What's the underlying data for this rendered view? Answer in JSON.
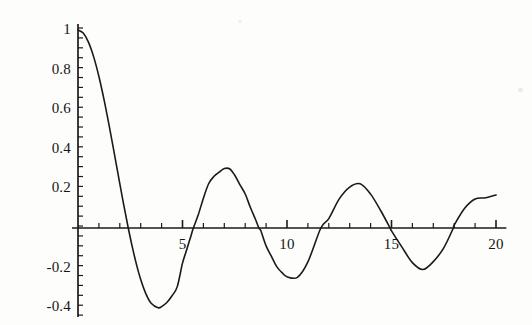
{
  "chart_data": {
    "type": "line",
    "title": "",
    "subtitle": "",
    "xlabel": "",
    "ylabel": "",
    "xlim": [
      0,
      20.4
    ],
    "ylim": [
      -0.44,
      1.02
    ],
    "grid": false,
    "legend": null,
    "axis_style": "crossing-at-origin",
    "minor_ticks": true,
    "x_ticks_major": [
      5,
      10,
      15,
      20
    ],
    "x_tick_labels": [
      "5",
      "10",
      "15",
      "20"
    ],
    "x_ticks_minor_step": 1,
    "y_ticks_major": [
      1,
      0.8,
      0.6,
      0.4,
      0.2,
      -0.2,
      -0.4
    ],
    "y_tick_labels": [
      "1",
      "0.8",
      "0.6",
      "0.4",
      "0.2",
      "-0.2",
      "-0.4"
    ],
    "y_ticks_minor_step": 0.05,
    "series": [
      {
        "name": "curve",
        "color": "#1a1a1a",
        "width": 1.6,
        "x": [
          0,
          0.25,
          0.5,
          0.75,
          1,
          1.25,
          1.5,
          1.75,
          2,
          2.2,
          2.4048,
          2.6,
          2.8,
          3,
          3.25,
          3.5,
          3.8317,
          4,
          4.25,
          4.5,
          4.75,
          5,
          5.2,
          5.4,
          5.5201,
          5.75,
          6,
          6.25,
          6.5,
          6.75,
          7,
          7.25,
          7.5,
          7.75,
          8,
          8.25,
          8.5,
          8.6537,
          8.75,
          9,
          9.25,
          9.5,
          9.75,
          10,
          10.5,
          11,
          11.6198,
          12,
          12.5,
          13,
          13.5,
          14,
          14.5,
          14.9309,
          15,
          15.5,
          16,
          16.5,
          17,
          17.5,
          17.9598,
          18,
          18.5,
          19,
          19.5,
          20
        ],
        "y": [
          1.0,
          0.9844,
          0.9385,
          0.8642,
          0.7652,
          0.6459,
          0.5118,
          0.369,
          0.2239,
          0.1104,
          0.0,
          -0.0968,
          -0.185,
          -0.2601,
          -0.3325,
          -0.3801,
          -0.4028,
          -0.3971,
          -0.3766,
          -0.3423,
          -0.2961,
          -0.1776,
          -0.1103,
          -0.0412,
          0.0,
          0.0652,
          0.1506,
          0.2236,
          0.2601,
          0.2818,
          0.3001,
          0.2991,
          0.2663,
          0.2178,
          0.1717,
          0.1035,
          0.0419,
          0.0,
          -0.0142,
          -0.0903,
          -0.1425,
          -0.1939,
          -0.2243,
          -0.2459,
          -0.249,
          -0.1712,
          0.0,
          0.0477,
          0.1469,
          0.2069,
          0.2235,
          0.1711,
          0.0847,
          0.0,
          -0.0142,
          -0.0968,
          -0.1749,
          -0.2097,
          -0.1699,
          -0.1003,
          0.0,
          0.0146,
          0.0996,
          0.1466,
          0.1525,
          0.167
        ],
        "description": "damped oscillating decay curve"
      }
    ]
  },
  "axes": {
    "x_axis_name": "horizontal-axis",
    "y_axis_name": "vertical-axis",
    "color": "#1a1a1a"
  },
  "ticks": {
    "x": [
      {
        "value": 5,
        "label": "5"
      },
      {
        "value": 10,
        "label": "10"
      },
      {
        "value": 15,
        "label": "15"
      },
      {
        "value": 20,
        "label": "20"
      }
    ],
    "y": [
      {
        "value": 1.0,
        "label": "1"
      },
      {
        "value": 0.8,
        "label": "0.8"
      },
      {
        "value": 0.6,
        "label": "0.6"
      },
      {
        "value": 0.4,
        "label": "0.4"
      },
      {
        "value": 0.2,
        "label": "0.2"
      },
      {
        "value": -0.2,
        "label": "-0.2"
      },
      {
        "value": -0.4,
        "label": "-0.4"
      }
    ]
  },
  "colors": {
    "background": "#fdfdfc",
    "curve": "#1a1a1a",
    "axis": "#1a1a1a",
    "text": "#151515"
  }
}
